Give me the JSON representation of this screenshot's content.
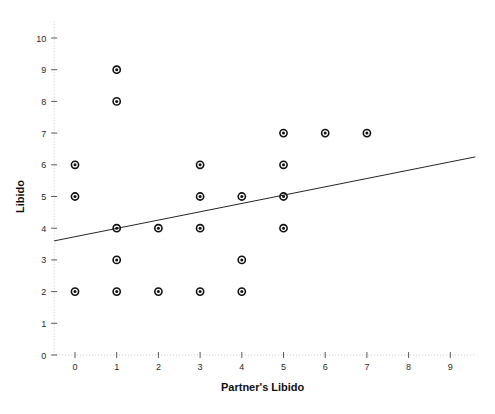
{
  "chart_data": {
    "type": "scatter",
    "title": "",
    "xlabel": "Partner's Libido",
    "ylabel": "Libido",
    "xlim": [
      -0.5,
      9.5
    ],
    "ylim": [
      0,
      10.4
    ],
    "xticks": [
      0,
      1,
      2,
      3,
      4,
      5,
      6,
      7,
      8,
      9
    ],
    "yticks": [
      0,
      1,
      2,
      3,
      4,
      5,
      6,
      7,
      8,
      9,
      10
    ],
    "grid": false,
    "legend": "none",
    "marker_style": "open-circle-with-center-dot",
    "points": [
      {
        "x": 0,
        "y": 6
      },
      {
        "x": 0,
        "y": 5
      },
      {
        "x": 0,
        "y": 2
      },
      {
        "x": 1,
        "y": 9
      },
      {
        "x": 1,
        "y": 8
      },
      {
        "x": 1,
        "y": 4
      },
      {
        "x": 1,
        "y": 3
      },
      {
        "x": 1,
        "y": 2
      },
      {
        "x": 2,
        "y": 4
      },
      {
        "x": 2,
        "y": 2
      },
      {
        "x": 3,
        "y": 6
      },
      {
        "x": 3,
        "y": 5
      },
      {
        "x": 3,
        "y": 4
      },
      {
        "x": 3,
        "y": 2
      },
      {
        "x": 4,
        "y": 5
      },
      {
        "x": 4,
        "y": 3
      },
      {
        "x": 4,
        "y": 2
      },
      {
        "x": 5,
        "y": 7
      },
      {
        "x": 5,
        "y": 6
      },
      {
        "x": 5,
        "y": 5
      },
      {
        "x": 5,
        "y": 4
      },
      {
        "x": 6,
        "y": 7
      },
      {
        "x": 7,
        "y": 7
      }
    ],
    "fit_line": {
      "name": "linear-fit",
      "x_start": -0.5,
      "y_start": 3.6,
      "x_end": 9.6,
      "y_end": 6.25
    },
    "colors": {
      "background": "#ffffff",
      "axis": "#c8c8c8",
      "tick": "#5a5a5a",
      "text": "#101010",
      "marker": "#111111",
      "fit_line": "#262626"
    }
  }
}
